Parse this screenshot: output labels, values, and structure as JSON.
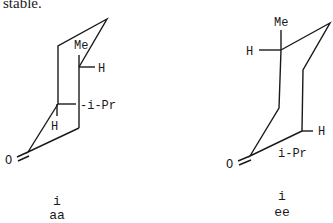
{
  "text": {
    "lead": "stable."
  },
  "structures": [
    {
      "id": "aa",
      "labels": {
        "me": "Me",
        "h_top": "H",
        "ipr": "-i-Pr",
        "h_bottom": "H",
        "oxygen": "O"
      },
      "caption": {
        "compound": "i",
        "conformer": "aa"
      }
    },
    {
      "id": "ee",
      "labels": {
        "me": "Me",
        "h_top": "H",
        "h_bottom": "H",
        "ipr": "i-Pr",
        "oxygen": "O"
      },
      "caption": {
        "compound": "i",
        "conformer": "ee"
      }
    }
  ]
}
